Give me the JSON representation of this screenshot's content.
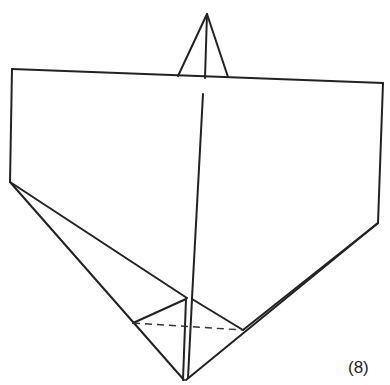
{
  "diagram": {
    "type": "origami-fold-step",
    "step_label": "(8)",
    "line_color": "#222222",
    "lines": [
      {
        "id": "peak-left",
        "from": [
          178,
          76
        ],
        "to": [
          207,
          14
        ]
      },
      {
        "id": "peak-center",
        "from": [
          207,
          14
        ],
        "to": [
          205,
          78
        ]
      },
      {
        "id": "peak-right",
        "from": [
          207,
          14
        ],
        "to": [
          228,
          77
        ]
      },
      {
        "id": "top-edge",
        "from": [
          12,
          69
        ],
        "to": [
          383,
          83
        ]
      },
      {
        "id": "left-edge",
        "from": [
          12,
          69
        ],
        "to": [
          10,
          182
        ]
      },
      {
        "id": "right-edge",
        "from": [
          383,
          83
        ],
        "to": [
          378,
          223
        ]
      },
      {
        "id": "center-crease",
        "from": [
          203,
          94
        ],
        "to": [
          192,
          298
        ]
      },
      {
        "id": "left-outer",
        "from": [
          10,
          182
        ],
        "to": [
          184,
          380
        ]
      },
      {
        "id": "left-inner",
        "from": [
          10,
          182
        ],
        "to": [
          187,
          298
        ]
      },
      {
        "id": "right-outer",
        "from": [
          378,
          223
        ],
        "to": [
          186,
          380
        ]
      },
      {
        "id": "right-inner",
        "from": [
          378,
          223
        ],
        "to": [
          243,
          330
        ]
      },
      {
        "id": "inner-left-flap",
        "from": [
          133,
          323
        ],
        "to": [
          186,
          299
        ]
      },
      {
        "id": "inner-right-flap",
        "from": [
          192,
          299
        ],
        "to": [
          243,
          330
        ]
      },
      {
        "id": "center-strip-left",
        "from": [
          186,
          299
        ],
        "to": [
          183,
          380
        ]
      },
      {
        "id": "center-strip-right",
        "from": [
          192,
          299
        ],
        "to": [
          188,
          378
        ]
      }
    ],
    "dashed_lines": [
      {
        "id": "valley-fold",
        "from": [
          133,
          323
        ],
        "to": [
          243,
          330
        ]
      }
    ]
  }
}
